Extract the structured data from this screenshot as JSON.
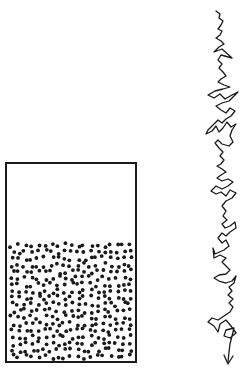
{
  "diagram": {
    "colors": {
      "ink": "#1a1a1a",
      "background": "#ffffff"
    },
    "container": {
      "x": 6,
      "y": 163,
      "width": 130,
      "height": 199,
      "stroke_width": 2
    },
    "particles": {
      "fill_top": 242,
      "fill_bottom": 360,
      "left": 9,
      "right": 133,
      "count": 330,
      "radius": 1.9,
      "seed": 7
    },
    "trajectory": {
      "stroke_width": 1.3,
      "points": [
        [
          216,
          11
        ],
        [
          220,
          14
        ],
        [
          219,
          18
        ],
        [
          223,
          21
        ],
        [
          221,
          25
        ],
        [
          218,
          29
        ],
        [
          222,
          31
        ],
        [
          220,
          35
        ],
        [
          216,
          38
        ],
        [
          221,
          41
        ],
        [
          224,
          44
        ],
        [
          219,
          47
        ],
        [
          214,
          52
        ],
        [
          222,
          49
        ],
        [
          232,
          58
        ],
        [
          221,
          55
        ],
        [
          218,
          60
        ],
        [
          222,
          64
        ],
        [
          219,
          68
        ],
        [
          223,
          72
        ],
        [
          226,
          76
        ],
        [
          221,
          79
        ],
        [
          218,
          82
        ],
        [
          224,
          85
        ],
        [
          230,
          87
        ],
        [
          223,
          89
        ],
        [
          215,
          91
        ],
        [
          208,
          95
        ],
        [
          214,
          98
        ],
        [
          220,
          94
        ],
        [
          225,
          99
        ],
        [
          232,
          95
        ],
        [
          238,
          92
        ],
        [
          233,
          97
        ],
        [
          229,
          101
        ],
        [
          222,
          103
        ],
        [
          216,
          106
        ],
        [
          221,
          110
        ],
        [
          226,
          113
        ],
        [
          230,
          108
        ],
        [
          235,
          111
        ],
        [
          231,
          116
        ],
        [
          226,
          119
        ],
        [
          222,
          123
        ],
        [
          218,
          120
        ],
        [
          213,
          125
        ],
        [
          208,
          130
        ],
        [
          206,
          134
        ],
        [
          212,
          131
        ],
        [
          216,
          126
        ],
        [
          219,
          132
        ],
        [
          223,
          128
        ],
        [
          227,
          122
        ],
        [
          231,
          127
        ],
        [
          236,
          124
        ],
        [
          232,
          130
        ],
        [
          230,
          136
        ],
        [
          233,
          142
        ],
        [
          229,
          146
        ],
        [
          222,
          144
        ],
        [
          218,
          140
        ],
        [
          215,
          143
        ],
        [
          219,
          148
        ],
        [
          223,
          152
        ],
        [
          220,
          156
        ],
        [
          224,
          160
        ],
        [
          221,
          164
        ],
        [
          217,
          166
        ],
        [
          222,
          169
        ],
        [
          226,
          172
        ],
        [
          221,
          175
        ],
        [
          217,
          178
        ],
        [
          222,
          181
        ],
        [
          228,
          179
        ],
        [
          233,
          182
        ],
        [
          228,
          186
        ],
        [
          222,
          189
        ],
        [
          216,
          186
        ],
        [
          211,
          191
        ],
        [
          216,
          194
        ],
        [
          221,
          192
        ],
        [
          226,
          196
        ],
        [
          230,
          190
        ],
        [
          236,
          193
        ],
        [
          232,
          198
        ],
        [
          226,
          201
        ],
        [
          222,
          206
        ],
        [
          226,
          211
        ],
        [
          223,
          216
        ],
        [
          227,
          220
        ],
        [
          222,
          224
        ],
        [
          225,
          228
        ],
        [
          230,
          226
        ],
        [
          235,
          222
        ],
        [
          236,
          228
        ],
        [
          230,
          232
        ],
        [
          226,
          236
        ],
        [
          222,
          233
        ],
        [
          218,
          238
        ],
        [
          222,
          243
        ],
        [
          226,
          240
        ],
        [
          229,
          246
        ],
        [
          224,
          250
        ],
        [
          215,
          254
        ],
        [
          213,
          248
        ],
        [
          214,
          258
        ],
        [
          220,
          255
        ],
        [
          226,
          258
        ],
        [
          222,
          262
        ],
        [
          226,
          266
        ],
        [
          230,
          270
        ],
        [
          226,
          274
        ],
        [
          219,
          275
        ],
        [
          214,
          278
        ],
        [
          219,
          281
        ],
        [
          226,
          283
        ],
        [
          232,
          281
        ],
        [
          236,
          276
        ],
        [
          234,
          283
        ],
        [
          229,
          287
        ],
        [
          232,
          291
        ],
        [
          228,
          295
        ],
        [
          233,
          299
        ],
        [
          229,
          303
        ],
        [
          233,
          307
        ],
        [
          230,
          312
        ],
        [
          224,
          316
        ],
        [
          218,
          320
        ],
        [
          212,
          318
        ],
        [
          208,
          322
        ],
        [
          214,
          326
        ],
        [
          218,
          332
        ],
        [
          220,
          324
        ],
        [
          226,
          320
        ],
        [
          231,
          326
        ],
        [
          236,
          333
        ],
        [
          230,
          338
        ],
        [
          224,
          336
        ],
        [
          226,
          330
        ],
        [
          234,
          328
        ],
        [
          232,
          336
        ],
        [
          230,
          344
        ],
        [
          229,
          352
        ],
        [
          228,
          362
        ]
      ],
      "arrow": {
        "tip": [
          228,
          364
        ],
        "left": [
          224,
          355
        ],
        "right": [
          233,
          356
        ]
      }
    }
  }
}
